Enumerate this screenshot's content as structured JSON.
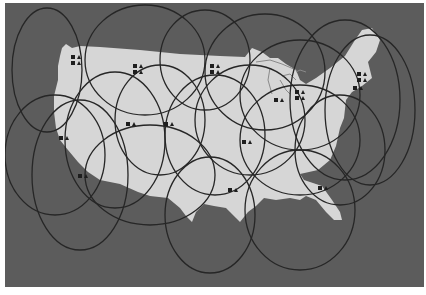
{
  "map": {
    "subject": "Contiguous United States satellite spot-beam coverage",
    "colors": {
      "page": "#ffffff",
      "ocean": "#5c5c5c",
      "land": "#d6d6d6",
      "beam_outline": "#262626",
      "marker": "#1e1e1e"
    },
    "beams": [
      {
        "cx": 47,
        "cy": 70,
        "rx": 35,
        "ry": 62
      },
      {
        "cx": 145,
        "cy": 60,
        "rx": 60,
        "ry": 55
      },
      {
        "cx": 205,
        "cy": 60,
        "rx": 45,
        "ry": 50
      },
      {
        "cx": 265,
        "cy": 72,
        "rx": 60,
        "ry": 58
      },
      {
        "cx": 300,
        "cy": 95,
        "rx": 60,
        "ry": 55
      },
      {
        "cx": 345,
        "cy": 100,
        "rx": 55,
        "ry": 80
      },
      {
        "cx": 370,
        "cy": 110,
        "rx": 45,
        "ry": 75
      },
      {
        "cx": 55,
        "cy": 155,
        "rx": 50,
        "ry": 60
      },
      {
        "cx": 80,
        "cy": 175,
        "rx": 48,
        "ry": 75
      },
      {
        "cx": 115,
        "cy": 140,
        "rx": 50,
        "ry": 68
      },
      {
        "cx": 160,
        "cy": 120,
        "rx": 45,
        "ry": 55
      },
      {
        "cx": 150,
        "cy": 175,
        "rx": 65,
        "ry": 50
      },
      {
        "cx": 215,
        "cy": 135,
        "rx": 50,
        "ry": 60
      },
      {
        "cx": 250,
        "cy": 120,
        "rx": 55,
        "ry": 55
      },
      {
        "cx": 300,
        "cy": 140,
        "rx": 60,
        "ry": 55
      },
      {
        "cx": 210,
        "cy": 215,
        "rx": 45,
        "ry": 58
      },
      {
        "cx": 300,
        "cy": 210,
        "rx": 55,
        "ry": 60
      },
      {
        "cx": 340,
        "cy": 150,
        "rx": 45,
        "ry": 55
      }
    ],
    "markers": [
      {
        "x": 71,
        "y": 55,
        "count": 2
      },
      {
        "x": 133,
        "y": 64,
        "count": 2
      },
      {
        "x": 210,
        "y": 64,
        "count": 2
      },
      {
        "x": 126,
        "y": 122,
        "count": 1
      },
      {
        "x": 164,
        "y": 122,
        "count": 1
      },
      {
        "x": 59,
        "y": 136,
        "count": 1
      },
      {
        "x": 78,
        "y": 174,
        "count": 1
      },
      {
        "x": 228,
        "y": 188,
        "count": 1
      },
      {
        "x": 318,
        "y": 186,
        "count": 1
      },
      {
        "x": 274,
        "y": 98,
        "count": 1
      },
      {
        "x": 295,
        "y": 90,
        "count": 2
      },
      {
        "x": 357,
        "y": 72,
        "count": 2
      },
      {
        "x": 353,
        "y": 86,
        "count": 1
      },
      {
        "x": 242,
        "y": 140,
        "count": 1
      }
    ]
  }
}
